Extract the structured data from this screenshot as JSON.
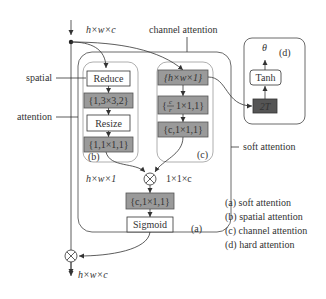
{
  "diagram": {
    "input_dim": "h×w×c",
    "output_dim": "h×w×c",
    "callouts": {
      "spatial": "spatial",
      "attention": "attention",
      "channel_attention": "channel attention",
      "soft_attention": "soft attention"
    },
    "spatial_branch": {
      "label": "(b)",
      "nodes": [
        "Reduce",
        "{1,3×3,2}",
        "Resize",
        "{1,1×1,1}"
      ],
      "output_dim": "h×w×1"
    },
    "channel_branch": {
      "label": "(c)",
      "nodes": [
        "{h×w×1}",
        "{c/r,1×1,1}",
        "{c,1×1,1}"
      ],
      "node2_frac_num": "c",
      "node2_frac_den": "r",
      "node2_rest": "1×1,1}",
      "output_dim": "1×1×c"
    },
    "soft_block": {
      "label": "(a)",
      "nodes": [
        "{c,1×1,1}",
        "Sigmoid"
      ]
    },
    "hard_block": {
      "label": "(d)",
      "output": "θ",
      "nodes": [
        "Tanh",
        "2T"
      ]
    },
    "legend": [
      "(a) soft attention",
      "(b) spatial attention",
      "(c) channel attention",
      "(d) hard attention"
    ],
    "colors": {
      "gray_box": "#9a9a9a",
      "dark_box": "#555555",
      "line": "#333333"
    }
  }
}
